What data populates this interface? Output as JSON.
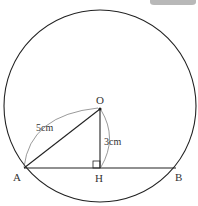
{
  "diagram": {
    "points": {
      "O": {
        "label": "O"
      },
      "A": {
        "label": "A"
      },
      "H": {
        "label": "H"
      },
      "B": {
        "label": "B"
      }
    },
    "lengths": {
      "OA": "5cm",
      "OH": "3cm"
    },
    "colors": {
      "stroke": "#222222",
      "tab": "#b8b8b8"
    }
  }
}
